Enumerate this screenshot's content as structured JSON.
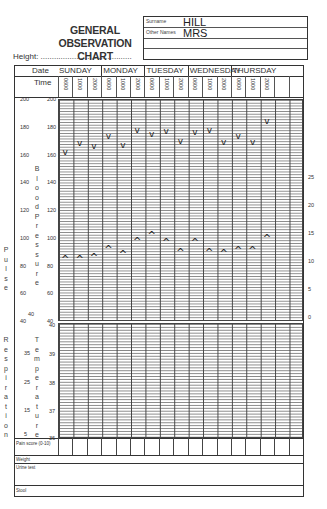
{
  "header": {
    "title_line1": "GENERAL OBSERVATION",
    "title_line2": "CHART",
    "height_label": "Height: ........................................."
  },
  "patient": {
    "surname_label": "Surname",
    "surname": "HILL",
    "other_names_label": "Other Names",
    "other_names": "MRS"
  },
  "table": {
    "date_label": "Date",
    "time_label": "Time",
    "days": [
      "SUNDAY",
      "MONDAY",
      "TUESDAY",
      "WEDNESDAY",
      "THURSDAY"
    ],
    "times": [
      "0600",
      "1000",
      "2000"
    ]
  },
  "axes": {
    "bp_pulse_ticks": [
      "200",
      "180",
      "160",
      "140",
      "120",
      "100",
      "80",
      "60",
      "40"
    ],
    "resp_ticks": [
      "40",
      "35",
      "25",
      "15",
      "5"
    ],
    "temp_ticks": [
      "40",
      "39",
      "38",
      "37",
      "36"
    ],
    "right_ticks": [
      "25",
      "20",
      "15",
      "10",
      "5",
      "0"
    ],
    "pulse_label": "Pulse",
    "bp_label": "Blood Pressure",
    "resp_label": "Respiration",
    "temp_label": "Temperature"
  },
  "rows": {
    "pain_score": "Pain score (0-10)",
    "weight": "Weight",
    "urine_test": "Urine test",
    "stool": "Stool"
  },
  "chart_data": {
    "type": "scatter",
    "categories": [
      "SUN 0600",
      "SUN 1000",
      "SUN 2000",
      "MON 0600",
      "MON 1000",
      "MON 2000",
      "TUE 0600",
      "TUE 1000",
      "TUE 2000",
      "WED 0600",
      "WED 1000",
      "WED 2000",
      "THU 0600",
      "THU 1000",
      "THU 2000"
    ],
    "series": [
      {
        "name": "Systolic (v)",
        "values": [
          162,
          168,
          166,
          173,
          167,
          178,
          175,
          177,
          170,
          176,
          178,
          169,
          173,
          169,
          184
        ]
      },
      {
        "name": "Diastolic (^)",
        "values": [
          85,
          85,
          86,
          92,
          88,
          98,
          102,
          97,
          90,
          97,
          90,
          89,
          91,
          91,
          100
        ]
      }
    ],
    "ylabel": "Blood Pressure / Pulse",
    "ylim": [
      40,
      200
    ]
  }
}
